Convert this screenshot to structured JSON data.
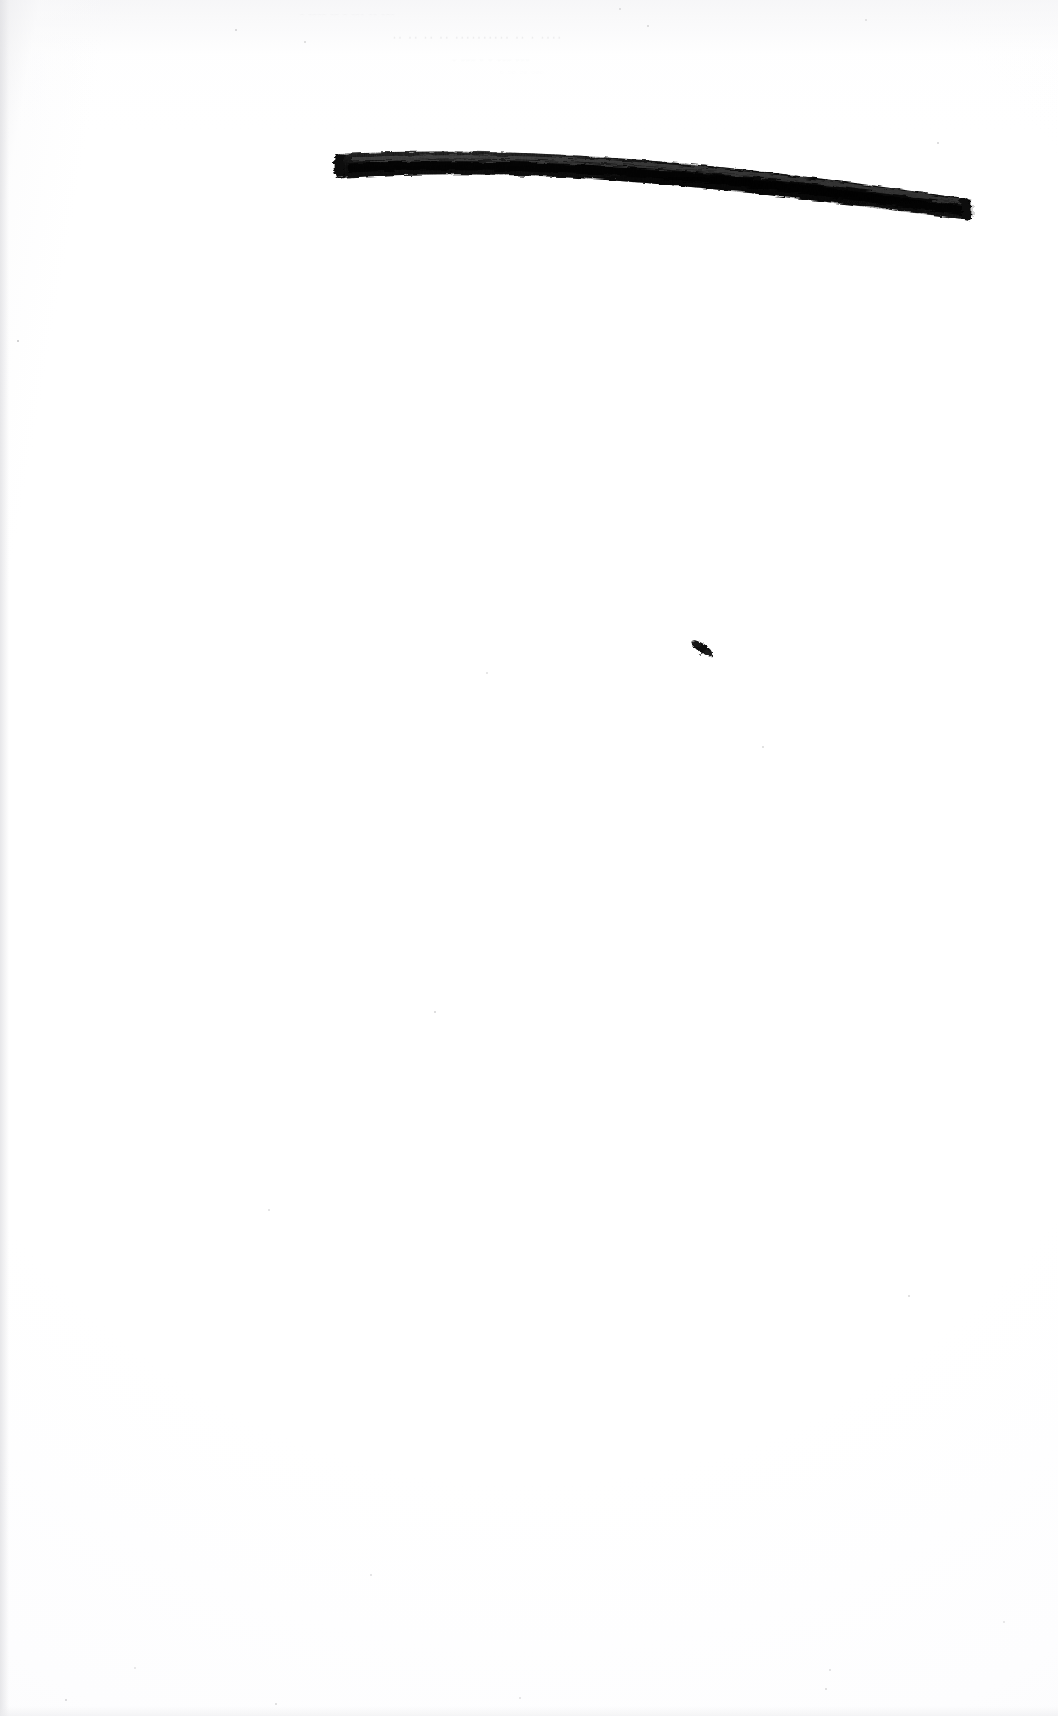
{
  "document": {
    "kind": "scanned-book-page",
    "page_label": "",
    "background_color": "#ffffff",
    "ink_color": "#141414",
    "paper_edge_color": "#e1e1e4",
    "width": 1058,
    "height": 1716
  },
  "ghost_text": {
    "note": "faint bleed-through / show-through from the reverse of the leaf; illegible",
    "main_line": "·· ··  ·· ·· ·········· ·· · ····",
    "upper_line": "·   ····   ·· ·  ···    ·· ···",
    "lower_line": "·  ··· ·   ·  ···   ···",
    "trailing_line": "·   ··  ·· ···"
  },
  "marks": {
    "redaction_bar": {
      "name": "ink-obliteration-stroke",
      "description": "heavy black brush stroke obliterating a line of text",
      "x_start": 337,
      "y_start": 150,
      "x_end": 972,
      "y_end": 212,
      "color": "#101010"
    },
    "ink_blot": {
      "name": "ink-speck",
      "description": "small elongated diagonal ink blot on the lower half of the page",
      "x": 700,
      "y": 648,
      "color": "#111111"
    }
  },
  "specks": [
    {
      "x": 18,
      "y": 341,
      "r": 1.3,
      "o": 0.3
    },
    {
      "x": 236,
      "y": 30,
      "r": 1.1,
      "o": 0.22
    },
    {
      "x": 305,
      "y": 42,
      "r": 1.0,
      "o": 0.2
    },
    {
      "x": 620,
      "y": 9,
      "r": 1.2,
      "o": 0.18
    },
    {
      "x": 648,
      "y": 26,
      "r": 1.0,
      "o": 0.2
    },
    {
      "x": 866,
      "y": 20,
      "r": 1.1,
      "o": 0.16
    },
    {
      "x": 938,
      "y": 143,
      "r": 1.0,
      "o": 0.22
    },
    {
      "x": 763,
      "y": 747,
      "r": 1.1,
      "o": 0.2
    },
    {
      "x": 487,
      "y": 673,
      "r": 0.9,
      "o": 0.16
    },
    {
      "x": 435,
      "y": 1012,
      "r": 1.2,
      "o": 0.22
    },
    {
      "x": 269,
      "y": 1210,
      "r": 1.0,
      "o": 0.18
    },
    {
      "x": 909,
      "y": 1296,
      "r": 1.1,
      "o": 0.2
    },
    {
      "x": 371,
      "y": 1575,
      "r": 1.0,
      "o": 0.18
    },
    {
      "x": 66,
      "y": 1700,
      "r": 1.2,
      "o": 0.22
    },
    {
      "x": 276,
      "y": 1704,
      "r": 1.0,
      "o": 0.2
    },
    {
      "x": 830,
      "y": 1670,
      "r": 1.0,
      "o": 0.18
    },
    {
      "x": 826,
      "y": 1689,
      "r": 1.1,
      "o": 0.2
    },
    {
      "x": 135,
      "y": 1668,
      "r": 0.9,
      "o": 0.14
    },
    {
      "x": 520,
      "y": 1698,
      "r": 1.0,
      "o": 0.16
    },
    {
      "x": 1004,
      "y": 1622,
      "r": 0.9,
      "o": 0.14
    }
  ]
}
